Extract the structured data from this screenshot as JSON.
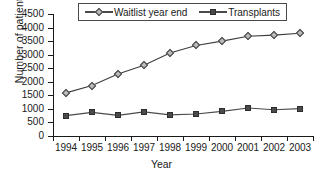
{
  "chart_data": {
    "type": "line",
    "title": "",
    "xlabel": "Year",
    "ylabel": "Number of patients",
    "categories": [
      1994,
      1995,
      1996,
      1997,
      1998,
      1999,
      2000,
      2001,
      2002,
      2003
    ],
    "xtick_labels": [
      "1994",
      "1995",
      "1996",
      "1997",
      "1998",
      "1999",
      "2000",
      "2001",
      "2002",
      "2003"
    ],
    "ytick_labels": [
      "0",
      "500",
      "1000",
      "1500",
      "2000",
      "2500",
      "3000",
      "3500",
      "4000",
      "4500"
    ],
    "ytick_values": [
      0,
      500,
      1000,
      1500,
      2000,
      2500,
      3000,
      3500,
      4000,
      4500
    ],
    "ylim": [
      0,
      4500
    ],
    "grid": false,
    "legend_position": "top-center",
    "series": [
      {
        "name": "Waitlist year end",
        "marker": "diamond",
        "color": "#3d3d3d",
        "marker_fill": "#b9b9b9",
        "values": [
          1590,
          1860,
          2290,
          2610,
          3060,
          3340,
          3500,
          3680,
          3720,
          3790
        ]
      },
      {
        "name": "Transplants",
        "marker": "square",
        "color": "#4a4a4a",
        "marker_fill": "#4a4a4a",
        "values": [
          750,
          870,
          760,
          890,
          780,
          810,
          910,
          1030,
          970,
          1010
        ]
      }
    ]
  }
}
